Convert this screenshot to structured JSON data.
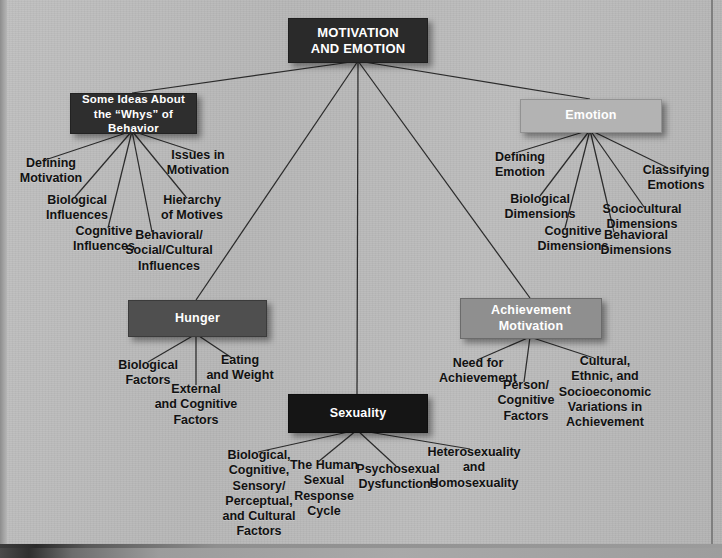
{
  "page": {
    "background_color": "#b9b9b9",
    "title_visible": false
  },
  "diagram": {
    "type": "concept-map",
    "root": {
      "label": "MOTIVATION\nAND EMOTION",
      "color": "#2a2a2a",
      "text_color": "#ffffff"
    },
    "branches": [
      {
        "id": "some-ideas",
        "label": "Some Ideas About\nthe “Whys” of Behavior",
        "color": "#2e2e2e",
        "text_color": "#ffffff",
        "children": [
          "Defining\nMotivation",
          "Biological\nInfluences",
          "Cognitive\nInfluences",
          "Behavioral/\nSocial/Cultural\nInfluences",
          "Hierarchy\nof Motives",
          "Issues in\nMotivation"
        ]
      },
      {
        "id": "hunger",
        "label": "Hunger",
        "color": "#4f4f4f",
        "text_color": "#ffffff",
        "children": [
          "Biological\nFactors",
          "External\nand Cognitive\nFactors",
          "Eating\nand Weight"
        ]
      },
      {
        "id": "sexuality",
        "label": "Sexuality",
        "color": "#151515",
        "text_color": "#ffffff",
        "children": [
          "Biological,\nCognitive,\nSensory/\nPerceptual,\nand Cultural\nFactors",
          "The Human\nSexual\nResponse\nCycle",
          "Psychosexual\nDysfunctions",
          "Heterosexuality\nand\nHomosexuality"
        ]
      },
      {
        "id": "achievement",
        "label": "Achievement\nMotivation",
        "color": "#8f8f8f",
        "text_color": "#ffffff",
        "children": [
          "Need for\nAchievement",
          "Person/\nCognitive\nFactors",
          "Cultural,\nEthnic, and\nSocioeconomic\nVariations in\nAchievement"
        ]
      },
      {
        "id": "emotion",
        "label": "Emotion",
        "color": "#b3b3b3",
        "text_color": "#ffffff",
        "children": [
          "Defining\nEmotion",
          "Biological\nDimensions",
          "Cognitive\nDimensions",
          "Behavioral\nDimensions",
          "Sociocultural\nDimensions",
          "Classifying\nEmotions"
        ]
      }
    ]
  }
}
